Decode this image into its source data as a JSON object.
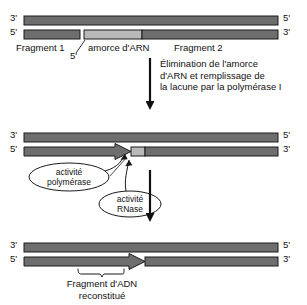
{
  "figure": {
    "colors": {
      "strand_dark": "#6e6e6e",
      "strand_light": "#b9b9b9",
      "outline": "#1a1a1a",
      "arrow": "#111111",
      "background": "#ffffff"
    }
  },
  "panel_top": {
    "left_top_label": "3'",
    "left_bottom_label": "5'",
    "right_top_label": "5'",
    "right_bottom_label": "3'",
    "primer_prime_label": "5'",
    "captions": {
      "fragment1": "Fragment 1",
      "primer": "amorce d'ARN",
      "fragment2": "Fragment 2"
    }
  },
  "step_arrow_1": {
    "text": "Élimination de l'amorce\nd'ARN et remplissage de\nla lacune par la polymérase I"
  },
  "panel_middle": {
    "left_top_label": "3'",
    "left_bottom_label": "5'",
    "right_top_label": "5'",
    "right_bottom_label": "3'",
    "callouts": {
      "polymerase": "activité\npolymérase",
      "rnase": "activité\nRNase"
    }
  },
  "panel_bottom": {
    "left_top_label": "3'",
    "left_bottom_label": "5'",
    "right_top_label": "5'",
    "right_bottom_label": "3'",
    "caption": "Fragment d'ADN\nreconstitué"
  }
}
